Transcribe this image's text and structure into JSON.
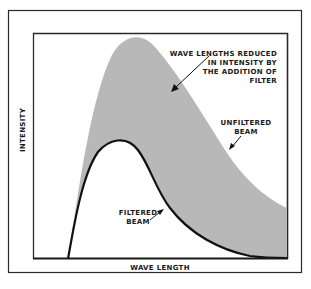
{
  "diagram": {
    "type": "spectrum-diagram",
    "axes": {
      "xlabel": "WAVE LENGTH",
      "ylabel": "INTENSITY"
    },
    "annotations": {
      "shaded_region": [
        "WAVE LENGTHS REDUCED",
        "IN INTENSITY BY",
        "THE ADDITION OF",
        "FILTER"
      ],
      "unfiltered": [
        "UNFILTERED",
        "BEAM"
      ],
      "filtered": [
        "FILTERED",
        "BEAM"
      ]
    },
    "colors": {
      "shaded": "#b8b8b8",
      "line": "#111111",
      "frame": "#2a2a2a",
      "background": "#ffffff"
    }
  }
}
